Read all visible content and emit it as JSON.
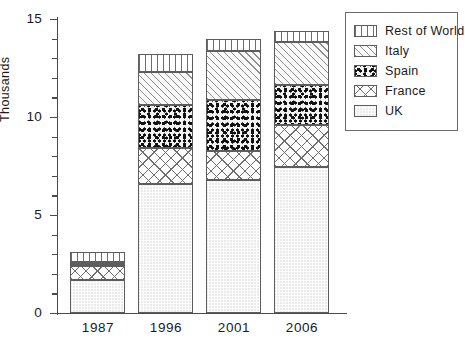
{
  "chart_data": {
    "type": "bar",
    "stacked": true,
    "title": "",
    "xlabel": "",
    "ylabel": "Thousands",
    "categories": [
      "1987",
      "1996",
      "2001",
      "2006"
    ],
    "ylim": [
      0,
      15
    ],
    "yticks": [
      0,
      5,
      10,
      15
    ],
    "ytick_labels": [
      "0",
      "5",
      "10",
      "15"
    ],
    "minor_tick_interval": 1,
    "grid": false,
    "legend_position": "top-right",
    "series": [
      {
        "name": "UK",
        "key": "uk",
        "pattern": "light-stipple",
        "values": [
          1.7,
          6.6,
          6.8,
          7.45
        ]
      },
      {
        "name": "France",
        "key": "france",
        "pattern": "crosshatch",
        "values": [
          0.7,
          1.8,
          1.45,
          2.15
        ]
      },
      {
        "name": "Spain",
        "key": "spain",
        "pattern": "dense-speckle",
        "values": [
          0.1,
          2.2,
          2.6,
          2.05
        ]
      },
      {
        "name": "Italy",
        "key": "italy",
        "pattern": "diagonal-hatch",
        "values": [
          0.1,
          1.7,
          2.5,
          2.2
        ]
      },
      {
        "name": "Rest of World",
        "key": "row",
        "pattern": "vertical-lines",
        "values": [
          0.5,
          0.9,
          0.65,
          0.55
        ]
      }
    ],
    "totals": [
      3.1,
      13.2,
      14.0,
      14.4
    ],
    "legend_order": [
      "Rest of World",
      "Italy",
      "Spain",
      "France",
      "UK"
    ],
    "colors": {
      "outline": "#5d5d5d",
      "axis": "#4a4a4a",
      "text": "#1a1a1a",
      "background": "#ffffff"
    }
  }
}
